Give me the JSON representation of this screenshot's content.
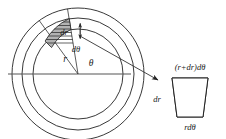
{
  "figure": {
    "labels": {
      "radius": "r",
      "angle": "θ",
      "radial_thickness": "dr",
      "angular_width": "dθ",
      "outer_arc_length": "(r+dr)dθ",
      "inner_arc_length": "rdθ",
      "trapezoid_height": "dr"
    },
    "colors": {
      "ink": "#222222",
      "cell_fill": "#b3b3b3",
      "axis": "#555555",
      "background": "#ffffff"
    },
    "geometry": {
      "center_x": 78,
      "center_y": 74,
      "circle_radii": [
        45,
        56,
        66
      ],
      "wedge_start_angle_deg": 99,
      "wedge_end_angle_deg": 126,
      "cell_inner_radius": 45,
      "cell_outer_radius": 56
    },
    "elements": {
      "circle_outer": "outer-circle",
      "circle_middle": "middle-circle",
      "circle_inner": "inner-circle",
      "diameter": "horizontal-diameter",
      "radial_a": "radial-line-upper",
      "radial_b": "radial-line-lower",
      "cell": "shaded-area-element",
      "dr_arrow": "dr-double-arrow",
      "leader": "callout-arrow",
      "trapezoid": "area-element-detail"
    }
  }
}
